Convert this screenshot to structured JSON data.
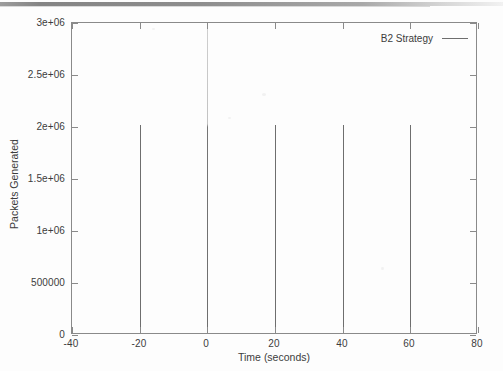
{
  "chart_data": {
    "type": "line",
    "plot_style": "impulses",
    "title": "",
    "xlabel": "Time (seconds)",
    "ylabel": "Packets Generated",
    "xlim": [
      -40,
      80
    ],
    "ylim": [
      0,
      3000000
    ],
    "xticks": [
      -40,
      -20,
      0,
      20,
      40,
      60,
      80
    ],
    "xtick_labels": [
      "-40",
      "-20",
      "0",
      "20",
      "40",
      "60",
      "80"
    ],
    "yticks": [
      0,
      500000,
      1000000,
      1500000,
      2000000,
      2500000,
      3000000
    ],
    "ytick_labels": [
      "0",
      "500000",
      "1e+06",
      "1.5e+06",
      "2e+06",
      "2.5e+06",
      "3e+06"
    ],
    "grid": false,
    "legend_position": "top-right-inside",
    "series": [
      {
        "name": "B2 Strategy",
        "color": "#6e6e6e",
        "x": [
          -20,
          0,
          20,
          40,
          60
        ],
        "values": [
          2000000,
          3000000,
          2000000,
          2000000,
          2000000
        ]
      }
    ]
  },
  "legend": {
    "entries": [
      {
        "label": "B2 Strategy"
      }
    ]
  },
  "axes": {
    "x_title": "Time (seconds)",
    "y_title": "Packets Generated"
  }
}
